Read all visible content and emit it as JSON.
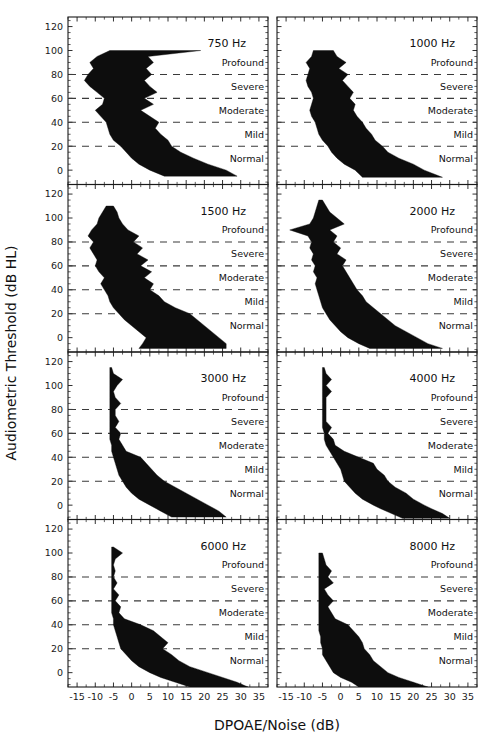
{
  "figure": {
    "xlabel": "DPOAE/Noise  (dB)",
    "ylabel": "Audiometric Threshold (dB HL)",
    "caption_ghost": ""
  },
  "axes": {
    "x_ticks": [
      -15,
      -10,
      -5,
      0,
      5,
      10,
      15,
      20,
      25,
      30,
      35
    ],
    "x_tick_labels": [
      "-15",
      "-10",
      "-5",
      "0",
      "5",
      "10",
      "15",
      "20",
      "25",
      "30",
      "35"
    ],
    "y_ticks": [
      0,
      20,
      40,
      60,
      80,
      100,
      120
    ],
    "y_tick_labels": [
      "0",
      "20",
      "40",
      "60",
      "80",
      "100",
      "120"
    ],
    "xlim": [
      -17.5,
      37.5
    ],
    "ylim": [
      -12,
      128
    ],
    "x_minor_step": 2.5,
    "y_minor_step": 5
  },
  "severity": {
    "labels": [
      "Profound",
      "Severe",
      "Moderate",
      "Mild",
      "Normal"
    ],
    "label_y": [
      90,
      70,
      50,
      30,
      10
    ],
    "line_y": [
      80,
      60,
      40,
      20
    ]
  },
  "chart_data": {
    "type": "area",
    "title": "",
    "xlabel": "DPOAE/Noise  (dB)",
    "ylabel": "Audiometric Threshold (dB HL)",
    "xlim": [
      -17.5,
      37.5
    ],
    "ylim": [
      -12,
      128
    ],
    "grid": false,
    "legend": "none",
    "panel_layout": {
      "rows": 4,
      "cols": 2
    },
    "panels": [
      {
        "label": "750 Hz",
        "row": 0,
        "col": 0,
        "y": [
          -5,
          0,
          5,
          10,
          15,
          20,
          25,
          30,
          35,
          40,
          45,
          50,
          55,
          60,
          65,
          70,
          75,
          80,
          85,
          90,
          95,
          100
        ],
        "x_lower": [
          9,
          5,
          2,
          0,
          -1.5,
          -3,
          -5,
          -6,
          -6.5,
          -7,
          -8.5,
          -10,
          -8,
          -7.5,
          -9.5,
          -11.5,
          -13,
          -12,
          -10.5,
          -11.5,
          -9.5,
          -6
        ],
        "x_upper": [
          29,
          26,
          21,
          17,
          13.5,
          11,
          10,
          8,
          6.5,
          7.5,
          5,
          2.5,
          6,
          3.5,
          7,
          5,
          3.5,
          5.5,
          4,
          6,
          4.5,
          19
        ]
      },
      {
        "label": "1000 Hz",
        "row": 0,
        "col": 1,
        "y": [
          -6,
          0,
          5,
          10,
          15,
          20,
          25,
          30,
          35,
          40,
          45,
          50,
          55,
          60,
          65,
          70,
          75,
          80,
          85,
          90,
          95,
          100
        ],
        "x_lower": [
          6,
          4,
          1,
          -1,
          -2.5,
          -3.5,
          -5,
          -6,
          -6.5,
          -7,
          -8,
          -8.5,
          -8,
          -7.5,
          -8,
          -9,
          -9.5,
          -9,
          -8.5,
          -9.5,
          -8,
          -7.5
        ],
        "x_upper": [
          28,
          23,
          20,
          16,
          13,
          11.5,
          9.5,
          8.5,
          7,
          6,
          4.5,
          3.5,
          4,
          2.5,
          3.5,
          2,
          0.5,
          2,
          -0.5,
          1.5,
          -1,
          -2
        ]
      },
      {
        "label": "1500 Hz",
        "row": 1,
        "col": 0,
        "y": [
          -9,
          -5,
          0,
          5,
          10,
          15,
          20,
          25,
          30,
          35,
          40,
          45,
          50,
          55,
          60,
          65,
          70,
          75,
          80,
          85,
          90,
          95,
          100,
          105,
          110
        ],
        "x_lower": [
          2,
          3,
          4,
          2,
          0,
          -2,
          -3.5,
          -5,
          -6,
          -6.5,
          -7.5,
          -8.5,
          -7.5,
          -9,
          -10,
          -9.5,
          -10.5,
          -11.5,
          -10.5,
          -12,
          -11,
          -9.5,
          -9,
          -8,
          -7
        ],
        "x_upper": [
          26,
          26,
          24,
          22,
          20,
          18,
          16,
          12,
          9,
          7.5,
          5,
          6,
          3.5,
          5.5,
          2.5,
          4.5,
          1.5,
          3,
          0.5,
          2,
          -1,
          -2.5,
          -3.5,
          -4,
          -5
        ]
      },
      {
        "label": "2000 Hz",
        "row": 1,
        "col": 1,
        "y": [
          -9,
          -5,
          0,
          5,
          10,
          15,
          20,
          25,
          30,
          35,
          40,
          45,
          50,
          55,
          60,
          65,
          70,
          75,
          80,
          85,
          90,
          95,
          100,
          105,
          110,
          115
        ],
        "x_lower": [
          8,
          5,
          2,
          0,
          -1.5,
          -3,
          -4,
          -5,
          -5.5,
          -6,
          -6.5,
          -7,
          -6.5,
          -7.5,
          -7,
          -8,
          -7.5,
          -8.5,
          -8,
          -9,
          -14,
          -8.5,
          -7.5,
          -7,
          -6.5,
          -6
        ],
        "x_upper": [
          28,
          24,
          21,
          18,
          15,
          13,
          11,
          9,
          7,
          6,
          4.5,
          3.5,
          2.5,
          1.5,
          0.5,
          1.5,
          -1,
          0,
          -2,
          -1,
          -3,
          1,
          -1,
          -3,
          -4,
          -5
        ]
      },
      {
        "label": "3000 Hz",
        "row": 2,
        "col": 0,
        "y": [
          -10,
          -5,
          0,
          5,
          10,
          15,
          20,
          25,
          30,
          35,
          40,
          45,
          50,
          55,
          60,
          65,
          70,
          75,
          80,
          85,
          90,
          95,
          100,
          105,
          110,
          115
        ],
        "x_lower": [
          11,
          8,
          5,
          2,
          0,
          -1.5,
          -2.5,
          -3.5,
          -4,
          -4.5,
          -5,
          -5.5,
          -5.5,
          -6,
          -6,
          -6,
          -6,
          -6,
          -6,
          -6,
          -6,
          -6,
          -6,
          -6,
          -6,
          -6
        ],
        "x_upper": [
          26,
          24,
          21,
          18,
          15,
          12,
          9,
          7,
          5.5,
          4,
          2.5,
          -1.5,
          -2.5,
          -3.5,
          -3,
          -4.5,
          -3.5,
          -4.5,
          -4.5,
          -3,
          -4.5,
          -5,
          -4,
          -2.5,
          -5,
          -5.5
        ]
      },
      {
        "label": "4000 Hz",
        "row": 2,
        "col": 1,
        "y": [
          -11,
          -7,
          -3,
          0,
          5,
          10,
          15,
          20,
          25,
          30,
          35,
          40,
          45,
          50,
          55,
          60,
          65,
          70,
          75,
          80,
          85,
          90,
          95,
          100,
          105,
          110,
          115
        ],
        "x_lower": [
          17,
          14,
          11,
          9,
          6,
          4,
          2.5,
          1,
          0.5,
          0,
          -1,
          -2,
          -3,
          -4,
          -4.5,
          -4.5,
          -5,
          -5,
          -5,
          -5,
          -5,
          -5,
          -5,
          -5,
          -5,
          -5,
          -5
        ],
        "x_upper": [
          30,
          28,
          25,
          23,
          20,
          18,
          15,
          13,
          12,
          10,
          9,
          5,
          1,
          -1.5,
          -2,
          -3.5,
          -2.5,
          -4,
          -4,
          -4,
          -4,
          -4,
          -2.5,
          -4,
          -2.5,
          -4,
          -4.5
        ]
      },
      {
        "label": "6000 Hz",
        "row": 3,
        "col": 0,
        "y": [
          -12,
          -8,
          -4,
          0,
          5,
          10,
          15,
          20,
          25,
          30,
          35,
          40,
          45,
          50,
          55,
          60,
          65,
          70,
          75,
          80,
          85,
          90,
          95,
          100,
          105
        ],
        "x_lower": [
          16,
          12,
          8,
          5,
          2,
          0,
          -1.5,
          -3,
          -3.5,
          -4,
          -4.5,
          -5,
          -5,
          -5.5,
          -5.5,
          -5.5,
          -5.5,
          -5.5,
          -5.5,
          -5.5,
          -5.5,
          -5.5,
          -5.5,
          -5.5,
          -5.5
        ],
        "x_upper": [
          32,
          29,
          25,
          21,
          16,
          13,
          11,
          8.5,
          10,
          8,
          6,
          2.5,
          -2,
          -3.5,
          -3,
          -4.5,
          -3.5,
          -5,
          -4,
          -5,
          -4.5,
          -5,
          -4.5,
          -2.5,
          -5
        ]
      },
      {
        "label": "8000 Hz",
        "row": 3,
        "col": 1,
        "y": [
          -12,
          -8,
          -4,
          0,
          5,
          10,
          15,
          20,
          25,
          30,
          35,
          40,
          45,
          50,
          55,
          60,
          65,
          70,
          75,
          80,
          85,
          90,
          95,
          100
        ],
        "x_lower": [
          5,
          3,
          0,
          -2,
          -3,
          -4,
          -5,
          -5,
          -5.5,
          -5.5,
          -6,
          -6,
          -6,
          -6,
          -6,
          -6,
          -6,
          -6,
          -6,
          -6,
          -6,
          -6,
          -6,
          -6
        ],
        "x_upper": [
          24,
          20,
          16,
          13,
          11,
          9,
          8,
          6.5,
          6,
          5,
          3.5,
          2,
          -1.5,
          -2.5,
          -3.5,
          -2,
          -3.5,
          -4.5,
          -2,
          -3.5,
          -2.5,
          -4,
          -4.5,
          -5
        ]
      }
    ]
  }
}
